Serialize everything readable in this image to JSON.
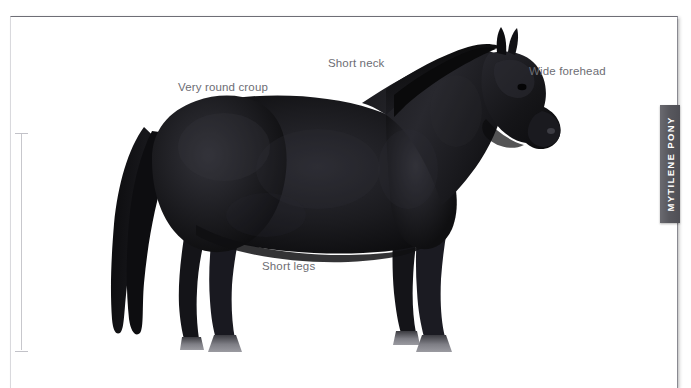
{
  "figure": {
    "clipped_header_text": "·                              ·",
    "breed_tab_label": "MYTILENE PONY",
    "colors": {
      "page_background": "#ffffff",
      "plate_background": "#ffffff",
      "frame_border_top": "#6e6e76",
      "frame_border_right": "#9a9aa2",
      "tab_background": "#5d5d63",
      "tab_text": "#ffffff",
      "annotation_text": "#6d6d74",
      "measure_line": "#c7c7cc",
      "coat_dark": "#151517",
      "coat_mid": "#232326",
      "coat_highlight": "#34343a",
      "hoof": "#8d8d92",
      "muzzle_highlight": "#3c3c42"
    }
  },
  "annotations": [
    {
      "id": "very-round-croup",
      "label": "Very round croup"
    },
    {
      "id": "short-neck",
      "label": "Short neck"
    },
    {
      "id": "wide-forehead",
      "label": "Wide forehead"
    },
    {
      "id": "short-legs",
      "label": "Short legs"
    }
  ],
  "measurement": {
    "name": "withers-height-rule",
    "orientation": "vertical",
    "has_end_caps": true
  }
}
